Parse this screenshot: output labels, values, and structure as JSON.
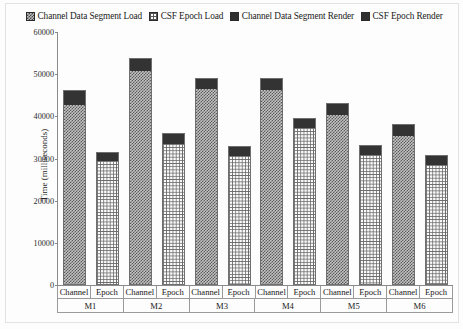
{
  "chart_data": {
    "type": "bar",
    "subtype": "stacked-grouped",
    "title": "",
    "xlabel": "",
    "ylabel": "Time (milliseconds)",
    "ylim": [
      0,
      60000
    ],
    "ytick_step": 10000,
    "yticks": [
      "60000",
      "50000",
      "40000",
      "30000",
      "20000",
      "10000",
      "0"
    ],
    "grid": false,
    "legend_position": "top",
    "groups": [
      "M1",
      "M2",
      "M3",
      "M4",
      "M5",
      "M6"
    ],
    "subcategories": [
      "Channel",
      "Epoch"
    ],
    "categories": [
      "M1 Channel",
      "M1 Epoch",
      "M2 Channel",
      "M2 Epoch",
      "M3 Channel",
      "M3 Epoch",
      "M4 Channel",
      "M4 Epoch",
      "M5 Channel",
      "M5 Epoch",
      "M6 Channel",
      "M6 Epoch"
    ],
    "series": [
      {
        "name": "Channel Data Segment Load",
        "swatch": "hatch-diagonal",
        "color": "#c2c2c2",
        "applies_to": "Channel",
        "values": [
          42900,
          null,
          51000,
          null,
          46700,
          null,
          46400,
          null,
          40600,
          null,
          35600,
          null
        ]
      },
      {
        "name": "CSF Epoch Load",
        "swatch": "grid-crosshatch",
        "color": "#fafafa",
        "applies_to": "Epoch",
        "values": [
          null,
          29600,
          null,
          33700,
          null,
          30800,
          null,
          37500,
          null,
          31000,
          null,
          28600
        ]
      },
      {
        "name": "Channel Data Segment Render",
        "swatch": "solid-dark",
        "color": "#333333",
        "applies_to": "Channel",
        "values": [
          3300,
          null,
          2800,
          null,
          2400,
          null,
          2700,
          null,
          2600,
          null,
          2600,
          null
        ]
      },
      {
        "name": "CSF Epoch Render",
        "swatch": "solid-dark",
        "color": "#333333",
        "applies_to": "Epoch",
        "values": [
          null,
          1900,
          null,
          2300,
          null,
          2200,
          null,
          2100,
          null,
          2200,
          null,
          2200
        ]
      }
    ],
    "bars": [
      {
        "group": "M1",
        "sub": "Channel",
        "load": 42900,
        "render": 3300,
        "total": 46200
      },
      {
        "group": "M1",
        "sub": "Epoch",
        "load": 29600,
        "render": 1900,
        "total": 31500
      },
      {
        "group": "M2",
        "sub": "Channel",
        "load": 51000,
        "render": 2800,
        "total": 53800
      },
      {
        "group": "M2",
        "sub": "Epoch",
        "load": 33700,
        "render": 2300,
        "total": 36000
      },
      {
        "group": "M3",
        "sub": "Channel",
        "load": 46700,
        "render": 2400,
        "total": 49100
      },
      {
        "group": "M3",
        "sub": "Epoch",
        "load": 30800,
        "render": 2200,
        "total": 33000
      },
      {
        "group": "M4",
        "sub": "Channel",
        "load": 46400,
        "render": 2700,
        "total": 49100
      },
      {
        "group": "M4",
        "sub": "Epoch",
        "load": 37500,
        "render": 2100,
        "total": 39600
      },
      {
        "group": "M5",
        "sub": "Channel",
        "load": 40600,
        "render": 2600,
        "total": 43200
      },
      {
        "group": "M5",
        "sub": "Epoch",
        "load": 31000,
        "render": 2200,
        "total": 33200
      },
      {
        "group": "M6",
        "sub": "Channel",
        "load": 35600,
        "render": 2600,
        "total": 38200
      },
      {
        "group": "M6",
        "sub": "Epoch",
        "load": 28600,
        "render": 2200,
        "total": 30800
      }
    ]
  },
  "legend": {
    "items": [
      {
        "label": "Channel Data Segment Load",
        "swatch": "hatch-diagonal"
      },
      {
        "label": "CSF Epoch Load",
        "swatch": "grid-crosshatch"
      },
      {
        "label": "Channel Data Segment Render",
        "swatch": "solid-dark"
      },
      {
        "label": "CSF Epoch Render",
        "swatch": "solid-dark"
      }
    ]
  },
  "axis": {
    "y_title": "Time (milliseconds)",
    "y_ticks": [
      "60000",
      "50000",
      "40000",
      "30000",
      "20000",
      "10000",
      "0"
    ],
    "x_sub_labels": [
      "Channel",
      "Epoch",
      "Channel",
      "Epoch",
      "Channel",
      "Epoch",
      "Channel",
      "Epoch",
      "Channel",
      "Epoch",
      "Channel",
      "Epoch"
    ],
    "x_group_labels": [
      "M1",
      "M2",
      "M3",
      "M4",
      "M5",
      "M6"
    ]
  },
  "colors": {
    "render_segment": "#333333",
    "channel_load_fill": "#c2c2c2",
    "epoch_load_fill": "#fafafa",
    "axis_line": "#8a8a8a",
    "text": "#1a1a1a"
  }
}
